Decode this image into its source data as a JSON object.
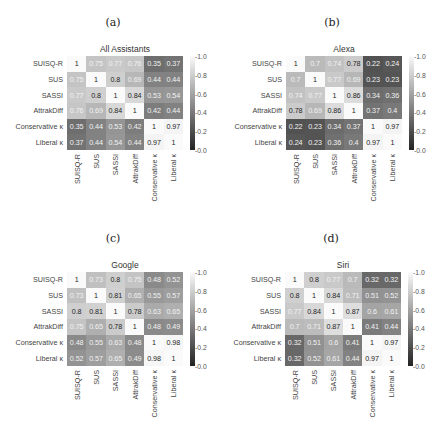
{
  "row_labels": [
    "SUISQ-R",
    "SUS",
    "SASSI",
    "AttrakDiff",
    "Conservative κ",
    "Liberal κ"
  ],
  "col_labels": [
    "SUISQ-R",
    "SUS",
    "SASSI",
    "AttrakDiff",
    "Conservative κ",
    "Liberal κ"
  ],
  "colorbar_ticks": [
    "1.0",
    "0.8",
    "0.6",
    "0.4",
    "0.2",
    "0.0"
  ],
  "panels": [
    {
      "label": "(a)",
      "title": "All Assistants"
    },
    {
      "label": "(b)",
      "title": "Alexa"
    },
    {
      "label": "(c)",
      "title": "Google"
    },
    {
      "label": "(d)",
      "title": "Siri"
    }
  ],
  "chart_data": [
    {
      "type": "heatmap",
      "panel": "(a)",
      "title": "All Assistants",
      "x": [
        "SUISQ-R",
        "SUS",
        "SASSI",
        "AttrakDiff",
        "Conservative κ",
        "Liberal κ"
      ],
      "y": [
        "SUISQ-R",
        "SUS",
        "SASSI",
        "AttrakDiff",
        "Conservative κ",
        "Liberal κ"
      ],
      "values": [
        [
          1,
          0.75,
          0.77,
          0.76,
          0.35,
          0.37
        ],
        [
          0.75,
          1,
          0.8,
          0.69,
          0.44,
          0.44
        ],
        [
          0.77,
          0.8,
          1,
          0.84,
          0.53,
          0.54
        ],
        [
          0.76,
          0.69,
          0.84,
          1,
          0.42,
          0.44
        ],
        [
          0.35,
          0.44,
          0.53,
          0.42,
          1,
          0.97
        ],
        [
          0.37,
          0.44,
          0.54,
          0.44,
          0.97,
          1
        ]
      ],
      "colorbar_range": [
        0.0,
        1.0
      ],
      "colormap": "gray"
    },
    {
      "type": "heatmap",
      "panel": "(b)",
      "title": "Alexa",
      "x": [
        "SUISQ-R",
        "SUS",
        "SASSI",
        "AttrakDiff",
        "Conservative κ",
        "Liberal κ"
      ],
      "y": [
        "SUISQ-R",
        "SUS",
        "SASSI",
        "AttrakDiff",
        "Conservative κ",
        "Liberal κ"
      ],
      "values": [
        [
          1,
          0.7,
          0.74,
          0.78,
          0.22,
          0.24
        ],
        [
          0.7,
          1,
          0.77,
          0.69,
          0.23,
          0.23
        ],
        [
          0.74,
          0.77,
          1,
          0.86,
          0.34,
          0.36
        ],
        [
          0.78,
          0.69,
          0.86,
          1,
          0.37,
          0.4
        ],
        [
          0.22,
          0.23,
          0.34,
          0.37,
          1,
          0.97
        ],
        [
          0.24,
          0.23,
          0.36,
          0.4,
          0.97,
          1
        ]
      ],
      "colorbar_range": [
        0.0,
        1.0
      ],
      "colormap": "gray"
    },
    {
      "type": "heatmap",
      "panel": "(c)",
      "title": "Google",
      "x": [
        "SUISQ-R",
        "SUS",
        "SASSI",
        "AttrakDiff",
        "Conservative κ",
        "Liberal κ"
      ],
      "y": [
        "SUISQ-R",
        "SUS",
        "SASSI",
        "AttrakDiff",
        "Conservative κ",
        "Liberal κ"
      ],
      "values": [
        [
          1,
          0.73,
          0.8,
          0.75,
          0.48,
          0.52
        ],
        [
          0.73,
          1,
          0.81,
          0.65,
          0.55,
          0.57
        ],
        [
          0.8,
          0.81,
          1,
          0.78,
          0.63,
          0.65
        ],
        [
          0.75,
          0.65,
          0.78,
          1,
          0.48,
          0.49
        ],
        [
          0.48,
          0.55,
          0.63,
          0.48,
          1,
          0.98
        ],
        [
          0.52,
          0.57,
          0.65,
          0.49,
          0.98,
          1
        ]
      ],
      "colorbar_range": [
        0.0,
        1.0
      ],
      "colormap": "gray"
    },
    {
      "type": "heatmap",
      "panel": "(d)",
      "title": "Siri",
      "x": [
        "SUISQ-R",
        "SUS",
        "SASSI",
        "AttrakDiff",
        "Conservative κ",
        "Liberal κ"
      ],
      "y": [
        "SUISQ-R",
        "SUS",
        "SASSI",
        "AttrakDiff",
        "Conservative κ",
        "Liberal κ"
      ],
      "values": [
        [
          1,
          0.8,
          0.77,
          0.7,
          0.32,
          0.32
        ],
        [
          0.8,
          1,
          0.84,
          0.71,
          0.51,
          0.52
        ],
        [
          0.77,
          0.84,
          1,
          0.87,
          0.6,
          0.61
        ],
        [
          0.7,
          0.71,
          0.87,
          1,
          0.41,
          0.44
        ],
        [
          0.32,
          0.51,
          0.6,
          0.41,
          1,
          0.97
        ],
        [
          0.32,
          0.52,
          0.61,
          0.44,
          0.97,
          1
        ]
      ],
      "colorbar_range": [
        0.0,
        1.0
      ],
      "colormap": "gray"
    }
  ]
}
